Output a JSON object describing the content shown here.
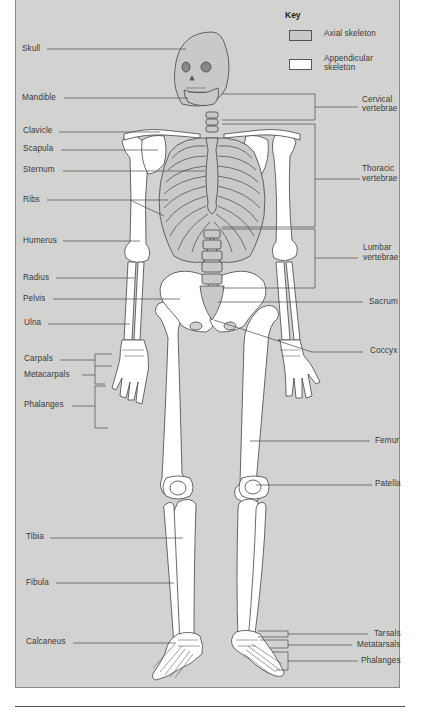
{
  "key": {
    "title": "Key",
    "items": [
      {
        "label": "Axial skeleton",
        "swatch": "#c9c9c7"
      },
      {
        "label": "Appendicular skeleton",
        "label_lines": [
          "Appendicular",
          "skeleton"
        ],
        "swatch": "#ffffff"
      }
    ]
  },
  "labels_left": {
    "skull": "Skull",
    "mandible": "Mandible",
    "clavicle": "Clavicle",
    "scapula": "Scapula",
    "sternum": "Sternum",
    "ribs": "Ribs",
    "humerus": "Humerus",
    "radius": "Radius",
    "pelvis": "Pelvis",
    "ulna": "Ulna",
    "carpals": "Carpals",
    "metacarpals": "Metacarpals",
    "phalanges": "Phalanges",
    "tibia": "Tibia",
    "fibula": "Fibula",
    "calcaneus": "Calcaneus"
  },
  "labels_right": {
    "cervical_1": "Cervical",
    "cervical_2": "vertebrae",
    "thoracic_1": "Thoracic",
    "thoracic_2": "vertebrae",
    "lumbar_1": "Lumbar",
    "lumbar_2": "vertebrae",
    "sacrum": "Sacrum",
    "coccyx": "Coccyx",
    "femur": "Femur",
    "patella": "Patella",
    "tarsals": "Tarsals",
    "metatarsals": "Metatarsals",
    "phalanges": "Phalanges"
  },
  "colors": {
    "background": "#d2d2d0",
    "axial": "#c9c9c7",
    "appendicular": "#ffffff",
    "outline": "#444444",
    "leader": "#4a4a4a"
  }
}
